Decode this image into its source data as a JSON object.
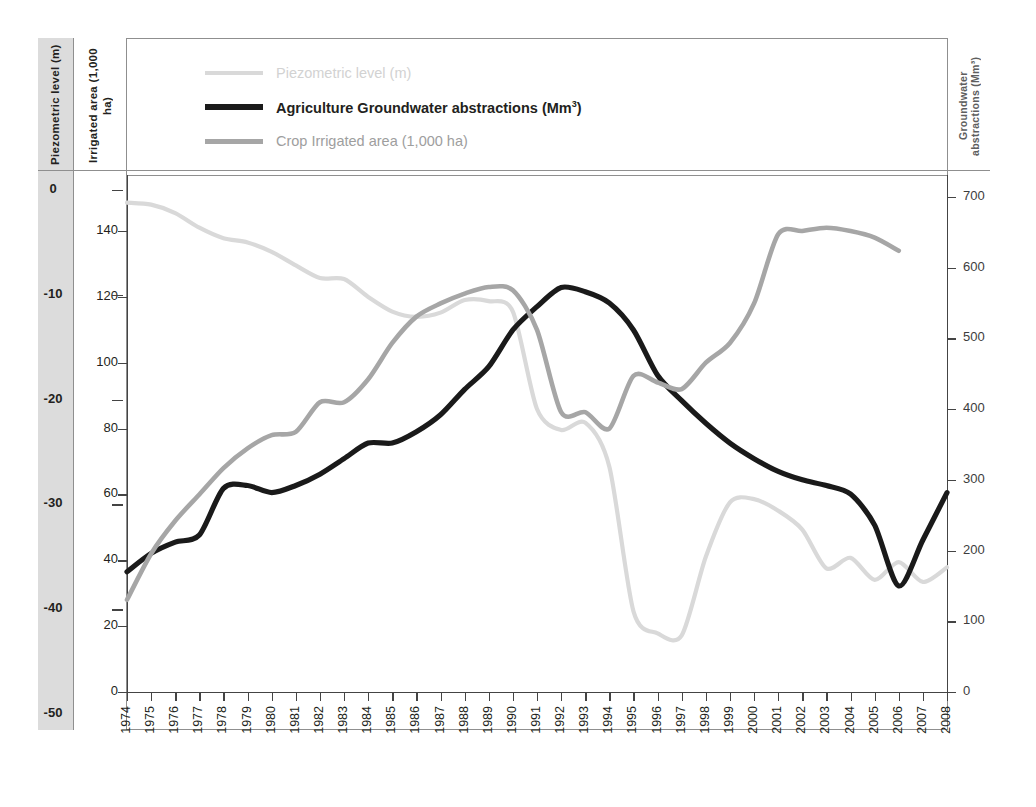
{
  "axes": {
    "piezometric_title": "Piezometric level (m)",
    "piezometric_title_line1": "Piezometric level",
    "piezometric_title_line2": "(m)",
    "irrigated_title_line1": "Irrigated area",
    "irrigated_title_line2": "(1,000 ha)",
    "groundwater_title_line1": "Groundwater",
    "groundwater_title_line2": "abstractions (Mm³)",
    "piezometric_ticks": [
      "0",
      "-10",
      "-20",
      "-30",
      "-40",
      "-50"
    ],
    "irrigated_ticks": [
      "140",
      "120",
      "100",
      "80",
      "60",
      "40",
      "20",
      "0"
    ],
    "groundwater_ticks": [
      "700",
      "600",
      "500",
      "400",
      "300",
      "200",
      "100",
      "0"
    ]
  },
  "legend": {
    "items": [
      {
        "label": "Piezometric level (m)",
        "color": "#d9d9d9",
        "style": "faint",
        "weight": "thin"
      },
      {
        "label_pre": "Agriculture Groundwater abstractions (Mm",
        "label_sup": "3",
        "label_post": ")",
        "label": "Agriculture Groundwater abstractions (Mm³)",
        "color": "#1a1a1a",
        "style": "bold",
        "weight": "thick"
      },
      {
        "label": "Crop Irrigated area (1,000 ha)",
        "color": "#a6a6a6",
        "style": "mid",
        "weight": "thin"
      }
    ]
  },
  "chart_data": {
    "type": "line",
    "title": "",
    "xlabel": "",
    "grid": false,
    "legend_position": "top-left",
    "x": [
      1974,
      1975,
      1976,
      1977,
      1978,
      1979,
      1980,
      1981,
      1982,
      1983,
      1984,
      1985,
      1986,
      1987,
      1988,
      1989,
      1990,
      1991,
      1992,
      1993,
      1994,
      1995,
      1996,
      1997,
      1998,
      1999,
      2000,
      2001,
      2002,
      2003,
      2004,
      2005,
      2006,
      2007,
      2008
    ],
    "xticklabels": [
      "1974",
      "1975",
      "1976",
      "1977",
      "1978",
      "1979",
      "1980",
      "1981",
      "1982",
      "1983",
      "1984",
      "1985",
      "1986",
      "1987",
      "1988",
      "1989",
      "1990",
      "1991",
      "1992",
      "1993",
      "1994",
      "1995",
      "1996",
      "1997",
      "1998",
      "1999",
      "2000",
      "2001",
      "2002",
      "2003",
      "2004",
      "2005",
      "2006",
      "2007",
      "2008"
    ],
    "series": [
      {
        "name": "Piezometric level (m)",
        "axis": "left-piezometric",
        "unit": "m",
        "color": "#d9d9d9",
        "ylim": [
          -50,
          0
        ],
        "yticks": [
          0,
          -10,
          -20,
          -30,
          -40,
          -50
        ],
        "values": [
          -1.2,
          -1.4,
          -2.2,
          -3.6,
          -4.6,
          -5.0,
          -5.9,
          -7.2,
          -8.4,
          -8.5,
          -10.2,
          -11.6,
          -12.1,
          -11.7,
          -10.5,
          -10.6,
          -11.6,
          -20.9,
          -22.9,
          -22.2,
          -26.4,
          -40.2,
          -42.3,
          -42.5,
          -35.0,
          -29.8,
          -29.5,
          -30.6,
          -32.4,
          -36.1,
          -35.1,
          -37.2,
          -35.5,
          -37.4,
          -36.0
        ],
        "last_year": 2008
      },
      {
        "name": "Agriculture Groundwater abstractions (Mm³)",
        "axis": "right-groundwater",
        "unit": "Mm³",
        "color": "#1a1a1a",
        "ylim": [
          0,
          700
        ],
        "yticks": [
          0,
          100,
          200,
          300,
          400,
          500,
          600,
          700
        ],
        "values": [
          170,
          196,
          212,
          222,
          288,
          292,
          282,
          292,
          308,
          330,
          352,
          352,
          368,
          392,
          428,
          460,
          512,
          545,
          572,
          566,
          550,
          512,
          448,
          412,
          380,
          352,
          330,
          312,
          300,
          292,
          280,
          236,
          150,
          215,
          282
        ],
        "note": "values read off right axis",
        "last_year": 2006
      },
      {
        "name": "Crop Irrigated area (1,000 ha)",
        "axis": "left-irrigated",
        "unit": "1,000 ha",
        "color": "#a6a6a6",
        "ylim": [
          0,
          140
        ],
        "yticks": [
          0,
          20,
          40,
          60,
          80,
          100,
          120,
          140
        ],
        "values": [
          28,
          42,
          52,
          60,
          68,
          74,
          78,
          79,
          88,
          88,
          95,
          106,
          114,
          118,
          121,
          123,
          122,
          110,
          85,
          85,
          80,
          96,
          94,
          92,
          100,
          106,
          118,
          139,
          140,
          141,
          140,
          138,
          134,
          null,
          null
        ],
        "last_year": 2006
      }
    ]
  }
}
